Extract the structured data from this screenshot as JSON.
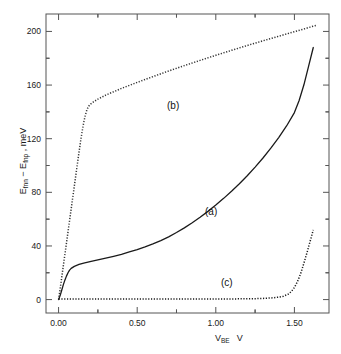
{
  "figure": {
    "background": "#ffffff",
    "frame_color": "#555555",
    "line_color": "#1a1a1a"
  },
  "axes": {
    "x_label_main": "V",
    "x_label_sub": "BE",
    "x_label_unit": "V",
    "y_label_parts": {
      "e1": "E",
      "e1_sub": "fnn",
      "minus": " − ",
      "e2": "E",
      "e2_sub": "fnp",
      "unit": " , meV"
    },
    "y_label_plain": "E fnn − E fnp , meV",
    "x_ticks": [
      "0.00",
      "0.50",
      "1.00",
      "1.50"
    ],
    "y_ticks": [
      "0",
      "40",
      "80",
      "120",
      "160",
      "200"
    ],
    "x_range": [
      -0.08,
      1.72
    ],
    "y_range": [
      -10,
      213
    ],
    "x_minor_per_major": 1,
    "y_minor_per_major": 1,
    "grid": false
  },
  "annotations": [
    {
      "text": "(a)",
      "x_px": 205,
      "y_px": 206
    },
    {
      "text": "(b)",
      "x_px": 167,
      "y_px": 100
    },
    {
      "text": "(c)",
      "x_px": 221,
      "y_px": 277
    }
  ],
  "chart_data": {
    "type": "line",
    "title": "",
    "xlabel": "V_BE , V",
    "ylabel": "E_fnn - E_fnp , meV",
    "xlim": [
      -0.08,
      1.72
    ],
    "ylim": [
      -10,
      213
    ],
    "xticks": [
      0.0,
      0.5,
      1.0,
      1.5
    ],
    "yticks": [
      0,
      40,
      80,
      120,
      160,
      200
    ],
    "grid": false,
    "legend": "inline-annotations",
    "series": [
      {
        "name": "(a)",
        "style": "solid",
        "color": "#1a1a1a",
        "x": [
          0.0,
          0.01,
          0.02,
          0.03,
          0.04,
          0.05,
          0.06,
          0.07,
          0.08,
          0.1,
          0.13,
          0.16,
          0.2,
          0.25,
          0.3,
          0.35,
          0.4,
          0.45,
          0.5,
          0.55,
          0.6,
          0.65,
          0.7,
          0.75,
          0.8,
          0.85,
          0.9,
          0.95,
          1.0,
          1.05,
          1.1,
          1.15,
          1.2,
          1.25,
          1.3,
          1.35,
          1.4,
          1.45,
          1.5,
          1.53,
          1.56,
          1.59,
          1.62
        ],
        "y": [
          0.0,
          3.0,
          7.0,
          11.0,
          14.5,
          17.5,
          20.0,
          22.0,
          23.3,
          24.8,
          26.2,
          27.2,
          28.3,
          29.6,
          30.9,
          32.3,
          33.8,
          35.5,
          37.3,
          39.3,
          41.5,
          44.0,
          46.8,
          50.0,
          53.5,
          57.3,
          61.4,
          65.8,
          70.5,
          75.5,
          80.8,
          86.4,
          92.4,
          98.8,
          105.6,
          112.9,
          120.8,
          129.5,
          139.5,
          148.5,
          160.0,
          174.0,
          188.0
        ]
      },
      {
        "name": "(b)",
        "style": "dotted",
        "color": "#333333",
        "x": [
          0.0,
          0.01,
          0.02,
          0.03,
          0.04,
          0.05,
          0.06,
          0.07,
          0.08,
          0.09,
          0.1,
          0.11,
          0.12,
          0.13,
          0.14,
          0.15,
          0.16,
          0.17,
          0.18,
          0.19,
          0.2,
          0.22,
          0.25,
          0.3,
          0.4,
          0.5,
          0.6,
          0.7,
          0.8,
          0.9,
          1.0,
          1.1,
          1.2,
          1.3,
          1.4,
          1.5,
          1.55,
          1.6,
          1.64
        ],
        "y": [
          0.0,
          8.0,
          16.5,
          25.0,
          33.5,
          42.0,
          50.5,
          59.0,
          67.5,
          76.0,
          84.5,
          93.0,
          101.5,
          110.0,
          118.0,
          125.5,
          132.0,
          137.5,
          141.5,
          144.0,
          145.5,
          147.3,
          149.5,
          152.5,
          157.5,
          162.0,
          166.3,
          170.5,
          174.5,
          178.4,
          182.2,
          185.9,
          189.5,
          193.0,
          196.4,
          199.8,
          201.5,
          203.2,
          204.6
        ]
      },
      {
        "name": "(c)",
        "style": "dotted",
        "color": "#1a1a1a",
        "x": [
          0.0,
          0.1,
          0.2,
          0.3,
          0.4,
          0.5,
          0.6,
          0.7,
          0.8,
          0.9,
          1.0,
          1.1,
          1.2,
          1.25,
          1.3,
          1.35,
          1.4,
          1.43,
          1.46,
          1.48,
          1.5,
          1.52,
          1.54,
          1.56,
          1.58,
          1.6,
          1.62
        ],
        "y": [
          0.5,
          0.5,
          0.5,
          0.5,
          0.5,
          0.5,
          0.5,
          0.5,
          0.5,
          0.5,
          0.5,
          0.5,
          0.6,
          0.7,
          0.9,
          1.2,
          1.8,
          2.5,
          4.0,
          6.0,
          9.0,
          13.5,
          19.5,
          27.0,
          35.0,
          43.5,
          52.0
        ]
      }
    ]
  }
}
